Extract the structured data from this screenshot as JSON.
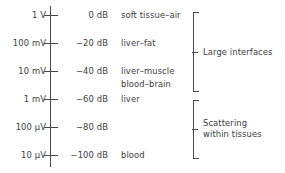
{
  "figure": {
    "type": "annotated-scale-diagram",
    "axis": {
      "orientation": "vertical",
      "tick_count": 6,
      "line_color": "#4a4a4a"
    },
    "rows": [
      {
        "voltage": "1 V",
        "db": "0 dB",
        "tissue": "soft tissue–air",
        "y": 15
      },
      {
        "voltage": "100 mV",
        "db": "−20 dB",
        "tissue": "liver–fat",
        "y": 43
      },
      {
        "voltage": "10 mV",
        "db": "−40 dB",
        "tissue": "liver–muscle",
        "y": 71
      },
      {
        "voltage": "1 mV",
        "db": "−60 dB",
        "tissue": "liver",
        "y": 99
      },
      {
        "voltage": "100 µV",
        "db": "−80 dB",
        "tissue": "",
        "y": 127
      },
      {
        "voltage": "10 µV",
        "db": "−100 dB",
        "tissue": "blood",
        "y": 155
      }
    ],
    "extra_tissue_label": {
      "text": "blood–brain",
      "y": 84
    },
    "groups": [
      {
        "label_line1": "Large interfaces",
        "label_line2": "",
        "top": 12,
        "bottom": 92,
        "stem_y": 52
      },
      {
        "label_line1": "Scattering",
        "label_line2": "within tissues",
        "top": 100,
        "bottom": 159,
        "stem_y": 129
      }
    ],
    "colors": {
      "background": "#ffffff",
      "ink": "#3b3b3b",
      "rule": "#4a4a4a"
    }
  }
}
